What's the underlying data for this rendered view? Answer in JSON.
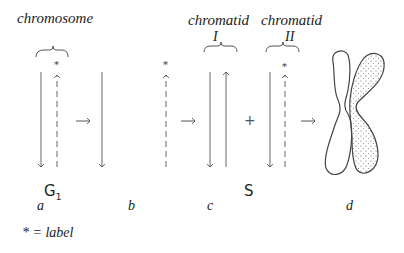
{
  "labels": {
    "chromosome": "chromosome",
    "chromatid_1": "chromatid",
    "chromatid_1_numeral": "I",
    "chromatid_2": "chromatid",
    "chromatid_2_numeral": "II",
    "phase_g1": "G",
    "phase_g1_sub": "1",
    "phase_s": "S",
    "panel_a": "a",
    "panel_b": "b",
    "panel_c": "c",
    "panel_d": "d",
    "plus": "+",
    "legend": "* = label"
  },
  "colors": {
    "line": "#555555",
    "text": "#222222",
    "stipple": "#666666"
  }
}
